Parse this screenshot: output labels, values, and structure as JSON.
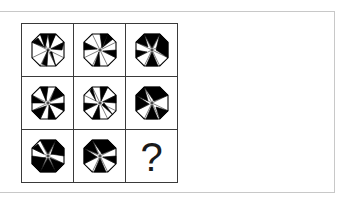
{
  "puzzle": {
    "prompt_symbol": "?",
    "octagon_outline": "4,12.2 12.2,4 27.8,4 36,12.2 36,27.8 27.8,36 12.2,36 4,27.8",
    "fill_color": "#000000",
    "stroke_color": "#000000",
    "cells": [
      {
        "row": 1,
        "col": 1,
        "lines": "12.2,4 20,20 27.8,4 M4,12.2 20,20 M36,12.2 20,20 M4,27.8 20,20 M36,27.8 20,20 M12.2,36 20,20 M27.8,36 20,20",
        "black": [
          "12.2,4 20,4 17,18",
          "20,4 27.8,4 22,18",
          "4,12.2 16,17 10,8",
          "36,12.2 23,19 34,20",
          "20,20 14,34 19,36",
          "22,22 27.8,36 24,22"
        ]
      },
      {
        "row": 1,
        "col": 2,
        "lines": "",
        "black": [
          "20,4 27.8,4 22,18",
          "4,12.2 4,20 17,19",
          "36,20 36,27.8 23,21",
          "14,36 20,36 19,22",
          "27.8,4 33,9 23,17"
        ]
      },
      {
        "row": 1,
        "col": 3,
        "lines": "",
        "black": [
          "12.2,4 27.8,4 20,18",
          "4,12.2 12.2,4 16,17",
          "27.8,4 36,12.2 36,27.8 24,20",
          "4,20 4,27.8 15,22",
          "14,36 26,36 20,22"
        ]
      },
      {
        "row": 2,
        "col": 1,
        "lines": "",
        "black": [
          "12.2,4 20,4 18,18",
          "27.8,4 36,12.2 22,18",
          "4,12.2 4,20 17,20",
          "36,20 36,27.8 22,21",
          "20,36 27.8,36 21,22",
          "4,27.8 12.2,36 18,23"
        ]
      },
      {
        "row": 2,
        "col": 2,
        "lines": "",
        "black": [
          "20,4 27.8,4 21,18",
          "4,20 4,27.8 17,21",
          "36,12.2 36,20 23,19",
          "12.2,36 20,36 19,22",
          "22,22 33,32 24,20",
          "10,8 16,18 12.2,4"
        ]
      },
      {
        "row": 2,
        "col": 3,
        "lines": "",
        "black": [
          "12.2,4 27.8,4 36,12.2 22,18",
          "4,12.2 12.2,4 16,18",
          "4,12.2 4,27.8 17,21",
          "14,36 26,36 20,22",
          "36,27.8 27.8,36 24,24"
        ]
      },
      {
        "row": 3,
        "col": 1,
        "lines": "",
        "black": [
          "12.2,4 27.8,4 20,18",
          "27.8,4 36,12.2 36,20 23,18",
          "4,20 4,27.8 12.2,36 18,22",
          "12.2,36 27.8,36 20,22",
          "27.8,36 36,27.8 22,22",
          "4,12.2 10,8 16,18"
        ]
      },
      {
        "row": 3,
        "col": 2,
        "lines": "",
        "black": [
          "12.2,4 27.8,4 36,12.2 22,18",
          "4,12.2 12.2,4 18,18",
          "4,12.2 4,27.8 17,21",
          "14,36 26,36 20,22",
          "36,20 36,27.8 23,21"
        ]
      }
    ]
  }
}
